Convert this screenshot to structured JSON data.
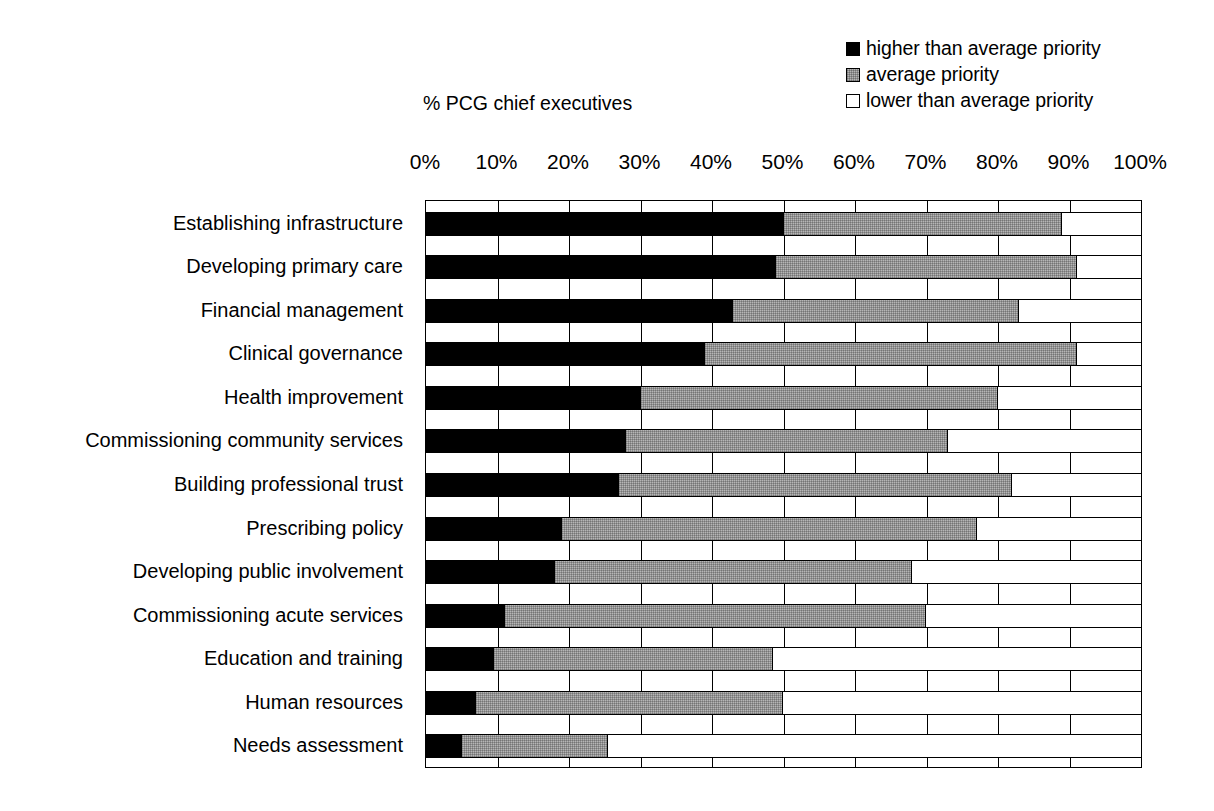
{
  "legend": {
    "position": "top-right",
    "items": [
      {
        "key": "high",
        "label": "higher than average priority",
        "color": "#000000",
        "icon": "filled-square-icon"
      },
      {
        "key": "avg",
        "label": "average priority",
        "color": "#b6b6b6",
        "icon": "hatched-square-icon"
      },
      {
        "key": "low",
        "label": "lower than average priority",
        "color": "#ffffff",
        "icon": "empty-square-icon"
      }
    ]
  },
  "axis": {
    "caption": "% PCG chief executives",
    "ticks": [
      "0%",
      "10%",
      "20%",
      "30%",
      "40%",
      "50%",
      "60%",
      "70%",
      "80%",
      "90%",
      "100%"
    ]
  },
  "chart_data": {
    "type": "bar",
    "orientation": "horizontal",
    "stacked": true,
    "title": "",
    "subtitle": "",
    "xlabel": "% PCG chief executives",
    "ylabel": "",
    "xlim": [
      0,
      100
    ],
    "xticks": [
      0,
      10,
      20,
      30,
      40,
      50,
      60,
      70,
      80,
      90,
      100
    ],
    "xtick_labels": [
      "0%",
      "10%",
      "20%",
      "30%",
      "40%",
      "50%",
      "60%",
      "70%",
      "80%",
      "90%",
      "100%"
    ],
    "grid": "vertical",
    "legend_position": "top-right",
    "categories": [
      "Establishing infrastructure",
      "Developing primary care",
      "Financial management",
      "Clinical governance",
      "Health improvement",
      "Commissioning community services",
      "Building professional trust",
      "Prescribing policy",
      "Developing public involvement",
      "Commissioning acute services",
      "Education and training",
      "Human resources",
      "Needs assessment"
    ],
    "series": [
      {
        "name": "higher than average priority",
        "color": "#000000",
        "values": [
          50,
          49,
          43,
          39,
          30,
          28,
          27,
          19,
          18,
          11,
          9.5,
          7,
          5
        ]
      },
      {
        "name": "average priority",
        "color": "#b6b6b6",
        "values": [
          39,
          42,
          40,
          52,
          50,
          45,
          55,
          58,
          50,
          59,
          39,
          43,
          20.5
        ]
      },
      {
        "name": "lower than average priority",
        "color": "#ffffff",
        "values": [
          11,
          9,
          17,
          9,
          20,
          27,
          18,
          23,
          32,
          30,
          51.5,
          50,
          74.5
        ]
      }
    ]
  }
}
